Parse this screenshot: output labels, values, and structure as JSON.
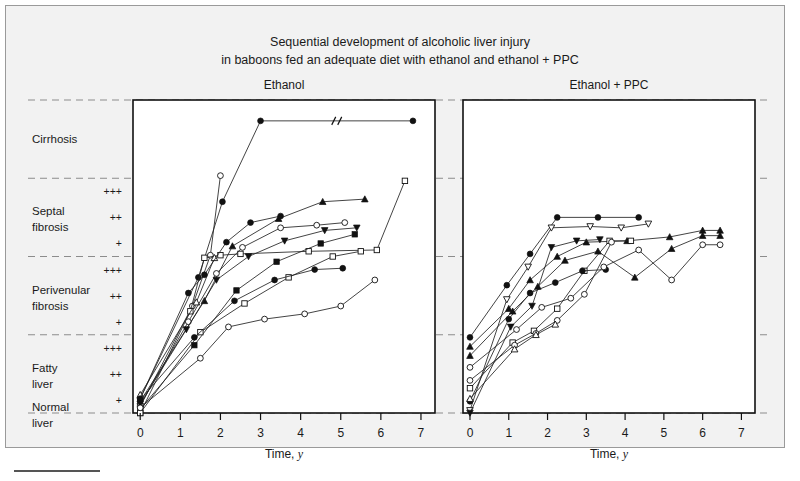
{
  "figure": {
    "title_line1": "Sequential development of alcoholic liver injury",
    "title_line2": "in baboons fed an adequate diet with ethanol and ethanol + PPC",
    "background_color": "#f2f2f2",
    "panel_color": "#ffffff",
    "ink_color": "#111111",
    "grid_color": "#8c8c8c"
  },
  "y_categories": [
    {
      "label_line1": "Cirrhosis",
      "label_line2": "",
      "grades": []
    },
    {
      "label_line1": "Septal",
      "label_line2": "fibrosis",
      "grades": [
        "+++",
        "++",
        "+"
      ]
    },
    {
      "label_line1": "Perivenular",
      "label_line2": "fibrosis",
      "grades": [
        "+++",
        "++",
        "+"
      ]
    },
    {
      "label_line1": "Fatty",
      "label_line2": "liver",
      "grades": [
        "+++",
        "++",
        "+"
      ]
    },
    {
      "label_line1": "Normal",
      "label_line2": "liver",
      "grades": []
    }
  ],
  "axes": {
    "x_title": "Time, ",
    "x_title_italic": "y",
    "x_ticks": [
      0,
      1,
      2,
      3,
      4,
      5,
      6,
      7
    ],
    "xlim": [
      -0.18,
      7.35
    ],
    "ylim": [
      0,
      12
    ],
    "gridlines_y": [
      12,
      9,
      6,
      3,
      0
    ],
    "grid": true,
    "legend": "none"
  },
  "chart_data": {
    "type": "line",
    "title": "Sequential development of alcoholic liver injury in baboons fed an adequate diet with ethanol and ethanol + PPC",
    "xlabel": "Time, y",
    "ylabel": "Liver injury stage",
    "xlim": [
      -0.18,
      7.35
    ],
    "ylim": [
      0,
      12
    ],
    "y_scale_note": "0 = Normal liver; 1-3 = Fatty liver + to +++; 4-6 = Perivenular fibrosis + to +++; 7-9 = Septal fibrosis + to +++; 10-12 = Cirrhosis",
    "panels": [
      {
        "name": "Ethanol",
        "title": "Ethanol",
        "series": [
          {
            "name": "E1",
            "marker": "filled-circle",
            "x": [
              0,
              1.45,
              2.05,
              3.0,
              6.8
            ],
            "y": [
              0.55,
              5.2,
              8.1,
              11.2,
              11.2
            ],
            "axis_break_after_index": 3
          },
          {
            "name": "E2",
            "marker": "open-circle",
            "x": [
              0,
              1.3,
              1.75,
              2.0
            ],
            "y": [
              0.25,
              4.1,
              6.05,
              9.1
            ]
          },
          {
            "name": "E3",
            "marker": "open-square",
            "x": [
              0,
              1.25,
              1.6,
              2.0,
              2.5,
              4.2,
              5.9,
              6.6
            ],
            "y": [
              0.0,
              3.9,
              5.95,
              6.05,
              6.1,
              6.2,
              6.25,
              8.9
            ]
          },
          {
            "name": "E4",
            "marker": "open-triangle",
            "x": [
              0,
              1.4,
              1.85
            ],
            "y": [
              0.7,
              4.25,
              5.95
            ]
          },
          {
            "name": "E5",
            "marker": "filled-triangle",
            "x": [
              0,
              1.6,
              2.3,
              3.45,
              4.55,
              5.6
            ],
            "y": [
              0.45,
              4.3,
              6.4,
              7.45,
              8.1,
              8.2
            ]
          },
          {
            "name": "E6",
            "marker": "filled-circle-2",
            "x": [
              0,
              1.2,
              1.6,
              2.15,
              2.75,
              3.5
            ],
            "y": [
              0.55,
              4.6,
              5.3,
              6.55,
              7.3,
              7.55
            ]
          },
          {
            "name": "E7",
            "marker": "open-circle-2",
            "x": [
              0,
              1.2,
              1.9,
              2.55,
              3.5,
              4.4,
              5.1
            ],
            "y": [
              0.3,
              3.5,
              5.35,
              6.35,
              7.1,
              7.2,
              7.3
            ]
          },
          {
            "name": "E8",
            "marker": "filled-down-triangle",
            "x": [
              0,
              1.15,
              1.9,
              2.7,
              3.6,
              4.6,
              5.4
            ],
            "y": [
              0.35,
              3.2,
              5.1,
              6.0,
              6.6,
              7.0,
              7.1
            ]
          },
          {
            "name": "E9",
            "marker": "filled-square",
            "x": [
              0,
              1.35,
              2.4,
              3.4,
              4.5,
              5.35
            ],
            "y": [
              0.15,
              2.6,
              4.7,
              5.8,
              6.5,
              6.85
            ]
          },
          {
            "name": "E10",
            "marker": "open-square-2",
            "x": [
              0,
              1.5,
              2.6,
              3.7,
              4.8,
              5.5
            ],
            "y": [
              0.0,
              3.1,
              4.2,
              5.2,
              6.0,
              6.2
            ]
          },
          {
            "name": "E11",
            "marker": "filled-circle-3",
            "x": [
              0,
              1.35,
              2.35,
              3.35,
              4.35,
              5.05
            ],
            "y": [
              0.5,
              2.9,
              4.3,
              5.1,
              5.5,
              5.55
            ]
          },
          {
            "name": "E12",
            "marker": "open-circle-3",
            "x": [
              0,
              1.5,
              2.2,
              3.1,
              4.1,
              5.0,
              5.85
            ],
            "y": [
              0.2,
              2.1,
              3.3,
              3.6,
              3.8,
              4.1,
              5.1
            ]
          }
        ]
      },
      {
        "name": "Ethanol + PPC",
        "title": "Ethanol + PPC",
        "series": [
          {
            "name": "P1",
            "marker": "filled-circle",
            "x": [
              0,
              0.95,
              1.55,
              2.25,
              3.3,
              4.35
            ],
            "y": [
              2.9,
              4.9,
              6.1,
              7.5,
              7.5,
              7.5
            ]
          },
          {
            "name": "P2",
            "marker": "open-down-triangle",
            "x": [
              0,
              0.95,
              1.5,
              2.1,
              3.1,
              3.9,
              4.6
            ],
            "y": [
              0.1,
              4.35,
              5.6,
              7.1,
              7.15,
              7.1,
              7.25
            ]
          },
          {
            "name": "P3",
            "marker": "filled-triangle",
            "x": [
              0,
              1.0,
              1.55,
              2.25,
              3.0,
              4.05,
              5.15,
              6.0,
              6.45
            ],
            "y": [
              2.55,
              4.0,
              5.1,
              6.0,
              6.55,
              6.6,
              6.75,
              7.0,
              7.0
            ]
          },
          {
            "name": "P4",
            "marker": "filled-down-triangle",
            "x": [
              0,
              1.05,
              1.6,
              2.1,
              2.75,
              3.35
            ],
            "y": [
              0.0,
              3.3,
              4.1,
              6.35,
              6.6,
              6.65
            ]
          },
          {
            "name": "P5",
            "marker": "open-square",
            "x": [
              0,
              1.1,
              1.65,
              2.25,
              2.95,
              3.6,
              4.15
            ],
            "y": [
              0.95,
              2.7,
              3.15,
              4.0,
              5.45,
              6.6,
              6.6
            ]
          },
          {
            "name": "P6",
            "marker": "open-circle",
            "x": [
              0,
              1.15,
              1.7,
              2.25,
              2.95,
              3.65
            ],
            "y": [
              1.25,
              2.6,
              3.05,
              3.55,
              4.55,
              6.55
            ]
          },
          {
            "name": "P7",
            "marker": "filled-circle-2",
            "x": [
              0,
              1.0,
              1.55,
              2.2,
              2.9,
              3.5
            ],
            "y": [
              0.45,
              3.6,
              4.6,
              5.0,
              5.45,
              5.5
            ]
          },
          {
            "name": "P8",
            "marker": "open-triangle",
            "x": [
              0,
              1.15,
              1.7,
              2.2
            ],
            "y": [
              0.55,
              2.45,
              3.0,
              3.4
            ]
          },
          {
            "name": "P9",
            "marker": "open-circle-2",
            "x": [
              0,
              1.2,
              1.85,
              2.6,
              3.45,
              4.35,
              5.2,
              6.0,
              6.45
            ],
            "y": [
              1.75,
              3.2,
              4.05,
              4.4,
              5.6,
              6.25,
              5.1,
              6.45,
              6.45
            ]
          },
          {
            "name": "P10",
            "marker": "filled-triangle-2",
            "x": [
              0,
              1.1,
              1.75,
              2.45,
              3.3,
              4.25,
              5.2,
              6.0,
              6.45
            ],
            "y": [
              2.2,
              3.9,
              4.85,
              5.85,
              6.2,
              5.2,
              6.3,
              6.8,
              6.8
            ]
          }
        ]
      }
    ]
  }
}
